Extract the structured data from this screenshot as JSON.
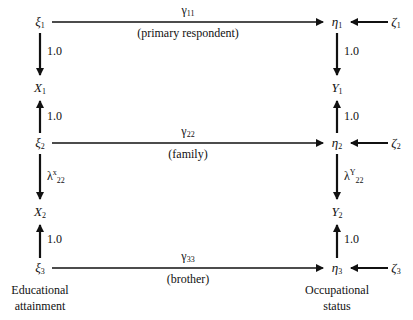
{
  "diagram": {
    "type": "structural-equation-path-diagram",
    "left_nodes": [
      {
        "id": "xi1",
        "symbol": "ξ",
        "sub": "1"
      },
      {
        "id": "X1",
        "symbol": "X",
        "sub": "1"
      },
      {
        "id": "xi2",
        "symbol": "ξ",
        "sub": "2"
      },
      {
        "id": "X2",
        "symbol": "X",
        "sub": "2"
      },
      {
        "id": "xi3",
        "symbol": "ξ",
        "sub": "3"
      }
    ],
    "right_nodes": [
      {
        "id": "eta1",
        "symbol": "η",
        "sub": "1"
      },
      {
        "id": "Y1",
        "symbol": "Y",
        "sub": "1"
      },
      {
        "id": "eta2",
        "symbol": "η",
        "sub": "2"
      },
      {
        "id": "Y2",
        "symbol": "Y",
        "sub": "2"
      },
      {
        "id": "eta3",
        "symbol": "η",
        "sub": "3"
      }
    ],
    "disturbances": [
      {
        "id": "zeta1",
        "symbol": "ζ",
        "sub": "1"
      },
      {
        "id": "zeta2",
        "symbol": "ζ",
        "sub": "2"
      },
      {
        "id": "zeta3",
        "symbol": "ζ",
        "sub": "3"
      }
    ],
    "paths": [
      {
        "symbol": "γ",
        "sub": "11",
        "description": "(primary respondent)"
      },
      {
        "symbol": "γ",
        "sub": "22",
        "description": "(family)"
      },
      {
        "symbol": "γ",
        "sub": "33",
        "description": "(brother)"
      }
    ],
    "left_loadings": [
      {
        "text": "1.0"
      },
      {
        "text": "1.0"
      },
      {
        "text": "λ",
        "sup": "x",
        "sub": "22"
      },
      {
        "text": "1.0"
      }
    ],
    "right_loadings": [
      {
        "text": "1.0"
      },
      {
        "text": "1.0"
      },
      {
        "text": "λ",
        "sup": "Y",
        "sub": "22"
      },
      {
        "text": "1.0"
      }
    ],
    "captions": {
      "left_line1": "Educational",
      "left_line2": "attainment",
      "right_line1": "Occupational",
      "right_line2": "status"
    }
  }
}
